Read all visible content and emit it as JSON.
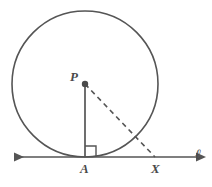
{
  "figure": {
    "background_color": "#ffffff",
    "stroke_color": "#555555",
    "label_color": "#4a4a4a",
    "width": 212,
    "height": 187
  },
  "labels": {
    "center_point": "P",
    "tangency_point": "A",
    "external_point": "X",
    "line": "ℓ"
  },
  "geometry": {
    "circle": {
      "center_x": 85,
      "center_y": 84,
      "radius": 73,
      "stroke_width": 1.6
    },
    "tangent_line": {
      "y": 157,
      "x_start": 6,
      "x_end": 205,
      "arrow_both_ends": true,
      "stroke_width": 1.6
    },
    "radius_segment": {
      "name": "PA",
      "x1": 85,
      "y1": 84,
      "x2": 85,
      "y2": 157,
      "style": "solid",
      "stroke_width": 1.7
    },
    "hypotenuse_segment": {
      "name": "PX",
      "x1": 85,
      "y1": 84,
      "x2": 155,
      "y2": 157,
      "style": "dashed",
      "dash_pattern": "5,4",
      "stroke_width": 1.6
    },
    "right_angle_mark": {
      "at": "A",
      "size": 11,
      "x": 85,
      "y": 157,
      "direction": "up-right",
      "stroke_width": 1.4
    },
    "center_dot": {
      "x": 85,
      "y": 84,
      "radius": 3.2
    }
  }
}
